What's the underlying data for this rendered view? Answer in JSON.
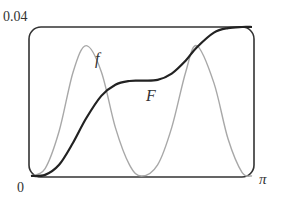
{
  "chart_data": {
    "type": "line",
    "title": "",
    "xlabel": "",
    "ylabel": "",
    "xlim": [
      0,
      3.14159
    ],
    "ylim": [
      0,
      0.04
    ],
    "x_tick_labels": [
      "0",
      "π"
    ],
    "y_tick_labels": [
      "0",
      "0.04"
    ],
    "grid": false,
    "legend": "inline curve labels",
    "series": [
      {
        "name": "f",
        "color": "#a8a8a8",
        "description": "two bell-shaped bumps peaking near x≈π/4 and x≈3π/4, zero at 0, π/2, π",
        "x": [
          0,
          0.2,
          0.4,
          0.6,
          0.785,
          1.0,
          1.2,
          1.4,
          1.571,
          1.8,
          2.0,
          2.2,
          2.356,
          2.6,
          2.8,
          3.0,
          3.1416
        ],
        "values": [
          0,
          0.002,
          0.012,
          0.028,
          0.035,
          0.028,
          0.013,
          0.003,
          0,
          0.003,
          0.013,
          0.028,
          0.035,
          0.025,
          0.01,
          0.001,
          0
        ]
      },
      {
        "name": "F",
        "color": "#222222",
        "description": "cumulative curve rising to a plateau at mid-height, then rising again to near the top",
        "x": [
          0,
          0.2,
          0.4,
          0.6,
          0.785,
          1.0,
          1.2,
          1.4,
          1.571,
          1.8,
          2.0,
          2.2,
          2.356,
          2.6,
          2.8,
          3.0,
          3.1416
        ],
        "values": [
          0,
          0.0003,
          0.003,
          0.009,
          0.0155,
          0.0215,
          0.0245,
          0.0255,
          0.0256,
          0.0258,
          0.0275,
          0.031,
          0.0345,
          0.0385,
          0.0397,
          0.04,
          0.04
        ]
      }
    ],
    "annotations": [
      {
        "text": "f",
        "near": "first peak of f"
      },
      {
        "text": "F",
        "near": "middle plateau of F"
      }
    ]
  },
  "labels": {
    "y_top": "0.04",
    "origin": "0",
    "x_right": "π",
    "f_label": "f",
    "F_label": "F"
  }
}
